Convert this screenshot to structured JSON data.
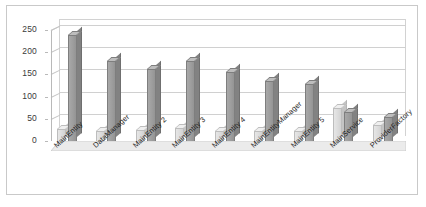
{
  "chart_data": {
    "type": "bar",
    "title": "",
    "subtitle": "",
    "xlabel": "",
    "ylabel": "",
    "ylim": [
      0,
      250
    ],
    "yticks": [
      0,
      50,
      100,
      150,
      200,
      250
    ],
    "grid": true,
    "legend": "none",
    "style": "3d-clustered-column",
    "categories": [
      "MainEntity",
      "DataManager",
      "MainEntity 2",
      "MainEntity 3",
      "MainEntity 4",
      "MainEntityManager",
      "MainEntity 5",
      "MainService",
      "ProviderFactory"
    ],
    "series": [
      {
        "name": "series-1-light",
        "color": "#dcdcdc",
        "values": [
          28,
          22,
          24,
          30,
          22,
          23,
          22,
          75,
          35
        ]
      },
      {
        "name": "series-2-dark",
        "color": "#9e9e9e",
        "values": [
          238,
          180,
          163,
          180,
          155,
          135,
          128,
          65,
          55
        ]
      }
    ]
  },
  "axis": {
    "y_tick_labels": [
      "250",
      "200",
      "150",
      "100",
      "50",
      "0"
    ]
  },
  "colors": {
    "background": "#ffffff",
    "frame": "#c9c9c9",
    "gridline": "#d0d0d0",
    "axis": "#b9b9b9",
    "series_light": "#dcdcdc",
    "series_dark": "#9e9e9e",
    "text": "#1d1d1d"
  }
}
